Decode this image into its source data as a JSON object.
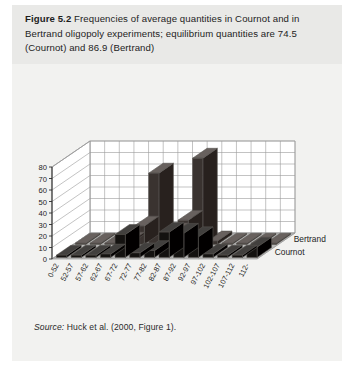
{
  "figure": {
    "label": "Figure 5.2",
    "caption_text": " Frequencies of average quantities in Cournot and in Bertrand oligopoly experiments; equilibrium quantities are 74.5 (Cournot) and 86.9 (Bertrand)",
    "source_prefix": "Source:",
    "source_text": " Huck et al. (2000, Figure 1)."
  },
  "colors": {
    "page_background": "#f2f2f0",
    "caption_background": "#e9e9e7",
    "bertrand_bar": "#3a3330",
    "cournot_bar": "#141210",
    "floor": "#b9b9b7",
    "wall": "#ffffff",
    "gridline": "#9a9a9a",
    "text": "#1d1d1d"
  },
  "chart_data": {
    "type": "bar",
    "title": "",
    "xlabel": "",
    "ylabel": "",
    "ylim": [
      0,
      80
    ],
    "yticks": [
      0,
      10,
      20,
      30,
      40,
      50,
      60,
      70,
      80
    ],
    "grid": true,
    "legend_position": "right",
    "three_d": true,
    "categories": [
      "0-52",
      "52-57",
      "57-62",
      "62-67",
      "67-72",
      "72-77",
      "77-82",
      "82-87",
      "87-92",
      "92-97",
      "97-102",
      "102-107",
      "107-112",
      "112-"
    ],
    "series": [
      {
        "name": "Bertrand",
        "values": [
          1,
          1,
          1,
          2,
          16,
          62,
          10,
          21,
          75,
          3,
          1,
          1,
          1,
          1
        ]
      },
      {
        "name": "Cournot",
        "values": [
          2,
          2,
          2,
          3,
          20,
          4,
          6,
          22,
          21,
          18,
          3,
          2,
          2,
          9
        ]
      }
    ],
    "legend": [
      "Bertrand",
      "Cournot"
    ]
  },
  "axis": {
    "tick_labels": [
      "80",
      "70",
      "60",
      "50",
      "40",
      "30",
      "20",
      "10",
      "0"
    ]
  }
}
